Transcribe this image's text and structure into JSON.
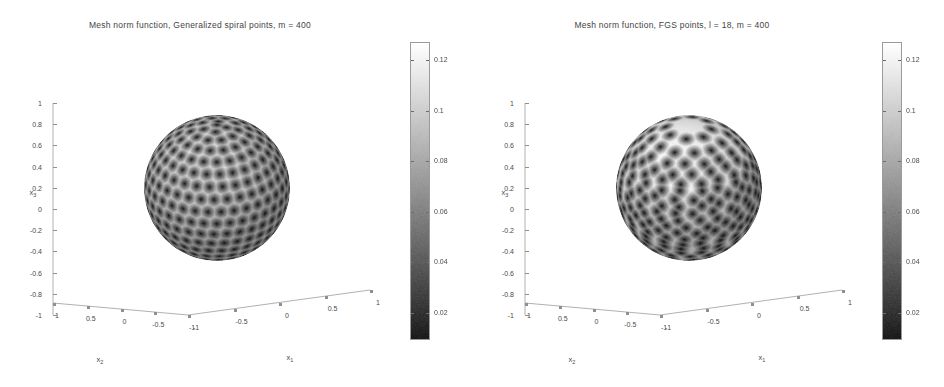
{
  "figure": {
    "width": 944,
    "height": 387,
    "background": "#ffffff",
    "panel_count": 2
  },
  "chart_data": [
    {
      "type": "heatmap",
      "title": "Mesh norm function, Generalized spiral points, m = 400",
      "subject": "mesh-norm-function-on-sphere",
      "point_set": "Generalized spiral points",
      "m": 400,
      "projection": "3d-sphere-surface",
      "xlabel": "x_1",
      "ylabel": "x_2",
      "zlabel": "x_3",
      "axis_x1_ticks": [
        "-1",
        "-0.5",
        "0",
        "0.5",
        "1"
      ],
      "axis_x2_ticks": [
        "1",
        "0.5",
        "0",
        "-0.5",
        "-1"
      ],
      "axis_x3_ticks": [
        "1",
        "0.8",
        "0.6",
        "0.4",
        "0.2",
        "0",
        "-0.2",
        "-0.4",
        "-0.6",
        "-0.8",
        "-1"
      ],
      "xlim": [
        -1,
        1
      ],
      "ylim": [
        -1,
        1
      ],
      "zlim": [
        -1,
        1
      ],
      "grid": false,
      "colormap": "gray",
      "colorbar": {
        "position": "right",
        "ticks": [
          "0.12",
          "0.1",
          "0.08",
          "0.06",
          "0.04",
          "0.02"
        ],
        "values": [
          0.12,
          0.1,
          0.08,
          0.06,
          0.04,
          0.02
        ],
        "clim": [
          0.012,
          0.132
        ],
        "low_color": "#2b2b2b",
        "high_color": "#ffffff"
      }
    },
    {
      "type": "heatmap",
      "title": "Mesh norm function, FGS points, l = 18, m = 400",
      "subject": "mesh-norm-function-on-sphere",
      "point_set": "FGS points",
      "l": 18,
      "m": 400,
      "projection": "3d-sphere-surface",
      "xlabel": "x_1",
      "ylabel": "x_2",
      "zlabel": "x_3",
      "axis_x1_ticks": [
        "-1",
        "-0.5",
        "0",
        "0.5",
        "1"
      ],
      "axis_x2_ticks": [
        "1",
        "0.5",
        "0",
        "-0.5",
        "-1"
      ],
      "axis_x3_ticks": [
        "1",
        "0.8",
        "0.6",
        "0.4",
        "0.2",
        "0",
        "-0.2",
        "-0.4",
        "-0.6",
        "-0.8",
        "-1"
      ],
      "xlim": [
        -1,
        1
      ],
      "ylim": [
        -1,
        1
      ],
      "zlim": [
        -1,
        1
      ],
      "grid": false,
      "colormap": "gray",
      "colorbar": {
        "position": "right",
        "ticks": [
          "0.12",
          "0.1",
          "0.08",
          "0.06",
          "0.04",
          "0.02"
        ],
        "values": [
          0.12,
          0.1,
          0.08,
          0.06,
          0.04,
          0.02
        ],
        "clim": [
          0.012,
          0.132
        ],
        "low_color": "#2b2b2b",
        "high_color": "#ffffff"
      }
    }
  ],
  "panels": [
    {
      "id": "left",
      "title": "Mesh norm function, Generalized spiral points, m = 400",
      "axis_labels": {
        "x1": "x",
        "x1_sub": "1",
        "x2": "x",
        "x2_sub": "2",
        "x3": "x",
        "x3_sub": "3"
      },
      "z_ticks": [
        "1",
        "0.8",
        "0.6",
        "0.4",
        "0.2",
        "0",
        "-0.2",
        "-0.4",
        "-0.6",
        "-0.8",
        "-1"
      ],
      "x2_ticks": [
        "1",
        "0.5",
        "0",
        "-0.5",
        "-1"
      ],
      "x1_ticks": [
        "-1",
        "-0.5",
        "0",
        "0.5",
        "1"
      ],
      "colorbar_ticks": [
        "0.12",
        "0.1",
        "0.08",
        "0.06",
        "0.04",
        "0.02"
      ]
    },
    {
      "id": "right",
      "title": "Mesh norm function, FGS points, l = 18, m = 400",
      "axis_labels": {
        "x1": "x",
        "x1_sub": "1",
        "x2": "x",
        "x2_sub": "2",
        "x3": "x",
        "x3_sub": "3"
      },
      "z_ticks": [
        "1",
        "0.8",
        "0.6",
        "0.4",
        "0.2",
        "0",
        "-0.2",
        "-0.4",
        "-0.6",
        "-0.8",
        "-1"
      ],
      "x2_ticks": [
        "1",
        "0.5",
        "0",
        "-0.5",
        "-1"
      ],
      "x1_ticks": [
        "-1",
        "-0.5",
        "0",
        "0.5",
        "1"
      ],
      "colorbar_ticks": [
        "0.12",
        "0.1",
        "0.08",
        "0.06",
        "0.04",
        "0.02"
      ]
    }
  ]
}
